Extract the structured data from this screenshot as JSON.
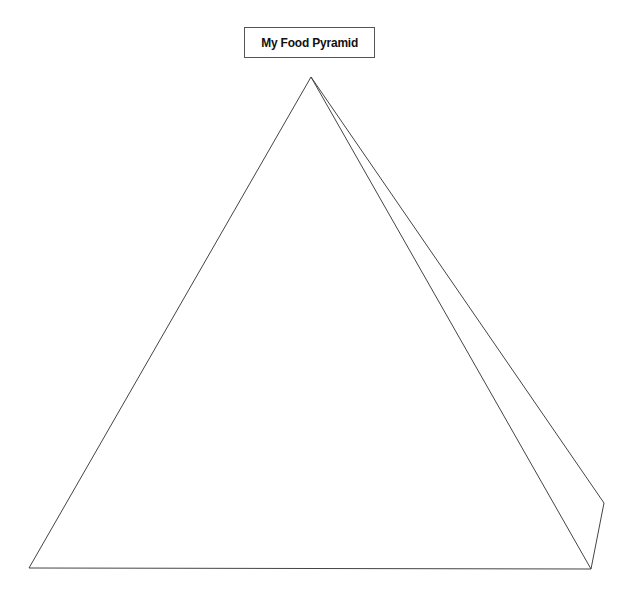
{
  "diagram": {
    "title": "My Food Pyramid",
    "line_color": "#444444",
    "background": "#ffffff",
    "shape": "pyramid-outline",
    "vertices": {
      "apex": [
        311,
        77
      ],
      "bottom_left": [
        29,
        568
      ],
      "bottom_right": [
        591,
        569
      ],
      "back_right": [
        604,
        503
      ]
    }
  }
}
